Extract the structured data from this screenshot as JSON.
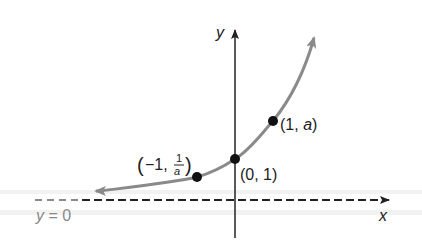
{
  "diagram": {
    "type": "exponential-function-graph",
    "axes": {
      "x_label": "x",
      "y_label": "y"
    },
    "asymptote": {
      "label_var": "y",
      "label_rest": " = 0"
    },
    "points": [
      {
        "name": "point-neg1",
        "label_open": "(−1, ",
        "frac_num": "1",
        "frac_den": "a",
        "label_close": ")"
      },
      {
        "name": "point-0",
        "label": "(0, 1)"
      },
      {
        "name": "point-1",
        "label_open": "(1, ",
        "label_var": "a",
        "label_close": ")"
      }
    ],
    "colors": {
      "curve": "#8a8a8a",
      "axis": "#222222",
      "asymptote_label": "#8a8a8a"
    }
  }
}
